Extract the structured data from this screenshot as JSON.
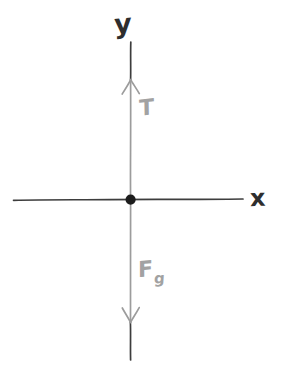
{
  "figure": {
    "kind": "hand-drawn-free-body-diagram",
    "width": 281,
    "height": 373,
    "background_color": "#ffffff"
  },
  "axes": {
    "y_axis_label": "y",
    "x_axis_label": "x",
    "axis_ink_color": "#3a3a3a",
    "vertical_axis": {
      "x": 130.5,
      "y_top": 42,
      "y_bottom": 360
    },
    "horizontal_axis": {
      "y": 199.5,
      "x_left": 13,
      "x_right": 243
    }
  },
  "origin": {
    "label": "point-mass",
    "x": 130.5,
    "y": 199.5,
    "radius": 5,
    "color": "#1c1c1c"
  },
  "forces": [
    {
      "id": "tension",
      "label": "T",
      "subscript": "",
      "direction": "up",
      "color": "#a2a2a2",
      "tail_y": 199.5,
      "head_y": 80,
      "label_x": 139,
      "label_y": 97
    },
    {
      "id": "weight",
      "label": "F",
      "subscript": "g",
      "direction": "down",
      "color": "#a2a2a2",
      "tail_y": 199.5,
      "head_y": 322,
      "label_x": 138,
      "label_y": 258
    }
  ]
}
